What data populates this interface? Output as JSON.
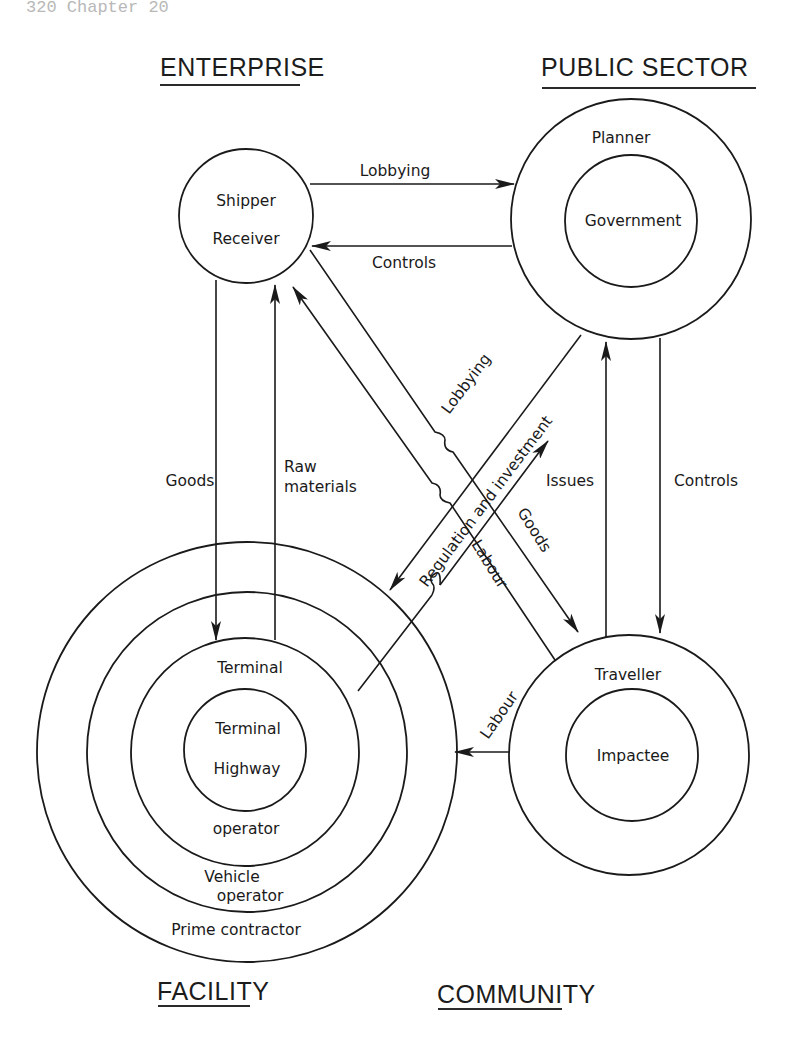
{
  "page_header": "320  Chapter 20",
  "groups": {
    "enterprise": {
      "title": "ENTERPRISE",
      "nodes": [
        "Shipper",
        "Receiver"
      ]
    },
    "public_sector": {
      "title": "PUBLIC SECTOR",
      "outer": "Planner",
      "inner": "Government"
    },
    "facility": {
      "title": "FACILITY",
      "rings": {
        "innermost": [
          "Terminal",
          "Highway"
        ],
        "third": {
          "top": "Terminal",
          "bottom": "operator"
        },
        "second": [
          "Vehicle",
          "operator"
        ],
        "outer": "Prime contractor"
      }
    },
    "community": {
      "title": "COMMUNITY",
      "outer": "Traveller",
      "inner": "Impactee"
    }
  },
  "flows": {
    "enterprise_to_public_lobbying": "Lobbying",
    "public_to_enterprise_controls": "Controls",
    "enterprise_to_facility_goods": "Goods",
    "facility_to_enterprise_raw": [
      "Raw",
      "materials"
    ],
    "facility_to_public_lobbying": "Lobbying",
    "public_to_facility_regulation": "Regulation and investment",
    "enterprise_to_community_goods": "Goods",
    "community_to_enterprise_labour": "Labour",
    "community_to_public_issues": "Issues",
    "public_to_community_controls": "Controls",
    "community_to_facility_labour": "Labour"
  },
  "colors": {
    "ink": "#1a1a1a",
    "paper": "#ffffff"
  }
}
